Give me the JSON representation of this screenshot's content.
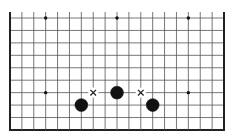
{
  "board": {
    "size": 19,
    "visible_rows": 10,
    "visible_cols": 19,
    "origin_x": 10,
    "origin_y": 18,
    "spacing_x": 11.89,
    "spacing_y": 12.44,
    "top_overhang": 6,
    "edges": {
      "left": true,
      "right": true,
      "bottom": true,
      "top": false
    },
    "colors": {
      "background": "#ffffff",
      "line": "#555555",
      "edge": "#222222",
      "stone_black": "#111111",
      "mark": "#222222",
      "star": "#111111"
    },
    "star_points": [
      {
        "col": 3,
        "row": 0
      },
      {
        "col": 9,
        "row": 0
      },
      {
        "col": 15,
        "row": 0
      },
      {
        "col": 3,
        "row": 6
      },
      {
        "col": 9,
        "row": 6
      },
      {
        "col": 15,
        "row": 6
      }
    ],
    "stones": [
      {
        "col": 9,
        "row": 6,
        "color": "black"
      },
      {
        "col": 6,
        "row": 7,
        "color": "black"
      },
      {
        "col": 12,
        "row": 7,
        "color": "black"
      }
    ],
    "marks": [
      {
        "col": 7,
        "row": 6,
        "type": "x"
      },
      {
        "col": 11,
        "row": 6,
        "type": "x"
      }
    ]
  }
}
